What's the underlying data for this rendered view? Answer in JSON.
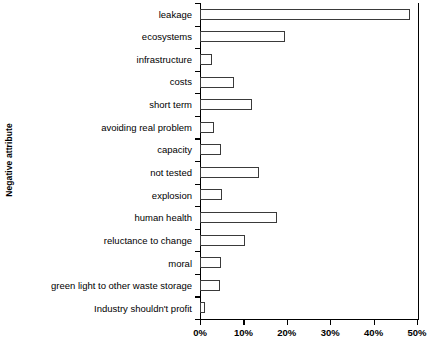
{
  "chart_data": {
    "type": "bar",
    "orientation": "horizontal",
    "title": "",
    "xlabel": "",
    "ylabel": "Negative attribute",
    "xlim": [
      0,
      50
    ],
    "xunit": "%",
    "grid": false,
    "legend": null,
    "xticks": [
      "0%",
      "10%",
      "20%",
      "30%",
      "40%",
      "50%"
    ],
    "xtick_values": [
      0,
      10,
      20,
      30,
      40,
      50
    ],
    "categories": [
      "leakage",
      "ecosystems",
      "infrastructure",
      "costs",
      "short term",
      "avoiding real problem",
      "capacity",
      "not tested",
      "explosion",
      "human health",
      "reluctance to change",
      "moral",
      "green light to other waste storage",
      "Industry shouldn't profit"
    ],
    "values": [
      48.5,
      19.5,
      2.8,
      7.8,
      11.9,
      3.2,
      4.8,
      13.5,
      5.0,
      17.7,
      10.3,
      4.8,
      4.6,
      1.2
    ],
    "bar_fill_color": "#ffffff",
    "bar_edge_color": "#3a3a3a",
    "axis_color": "#000000"
  }
}
